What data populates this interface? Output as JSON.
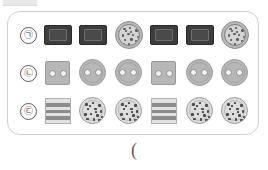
{
  "figure": {
    "title": "",
    "bottom_caption": "(",
    "panel": {
      "border_color": "#cfcfcf",
      "background": "#ffffff"
    },
    "rows": [
      {
        "label": "㉠",
        "label_name": "row-label-giyeok",
        "items": [
          {
            "kind": "dark-rect",
            "name": "brownie-rectangle"
          },
          {
            "kind": "dark-rect",
            "name": "brownie-rectangle"
          },
          {
            "kind": "speckle-circle",
            "name": "speckled-round-cookie"
          },
          {
            "kind": "dark-rect",
            "name": "brownie-rectangle"
          },
          {
            "kind": "dark-rect",
            "name": "brownie-rectangle"
          },
          {
            "kind": "speckle-circle",
            "name": "speckled-round-cookie"
          }
        ]
      },
      {
        "label": "㉡",
        "label_name": "row-label-nieun",
        "items": [
          {
            "kind": "hole-square",
            "name": "two-hole-square-cracker"
          },
          {
            "kind": "hole-circle",
            "name": "two-hole-round-cracker"
          },
          {
            "kind": "hole-circle",
            "name": "two-hole-round-cracker"
          },
          {
            "kind": "hole-square",
            "name": "two-hole-square-cracker"
          },
          {
            "kind": "hole-circle",
            "name": "two-hole-round-cracker"
          },
          {
            "kind": "hole-circle",
            "name": "two-hole-round-cracker"
          }
        ]
      },
      {
        "label": "㉢",
        "label_name": "row-label-digeut",
        "items": [
          {
            "kind": "striped-square",
            "name": "striped-wafer-square"
          },
          {
            "kind": "chip-circle",
            "name": "chocolate-chip-round-cookie"
          },
          {
            "kind": "chip-circle",
            "name": "chocolate-chip-round-cookie"
          },
          {
            "kind": "striped-square",
            "name": "striped-wafer-square"
          },
          {
            "kind": "chip-circle",
            "name": "chocolate-chip-round-cookie"
          },
          {
            "kind": "chip-circle",
            "name": "chocolate-chip-round-cookie"
          }
        ]
      }
    ],
    "colors": {
      "dark_item": "#3d3d3d",
      "light_item": "#b7b7b7",
      "stripe": "#8c8c8c",
      "chip": "#4d4d4d",
      "hole": "#f2f2f2"
    },
    "speckle_positions": [
      [
        4,
        3,
        3,
        2
      ],
      [
        10,
        2,
        2,
        2
      ],
      [
        16,
        4,
        3,
        3
      ],
      [
        21,
        7,
        2,
        2
      ],
      [
        3,
        9,
        2,
        3
      ],
      [
        8,
        8,
        3,
        2
      ],
      [
        13,
        9,
        2,
        2
      ],
      [
        18,
        11,
        3,
        2
      ],
      [
        5,
        14,
        2,
        2
      ],
      [
        11,
        13,
        3,
        3
      ],
      [
        16,
        15,
        2,
        2
      ],
      [
        21,
        13,
        2,
        3
      ],
      [
        3,
        18,
        3,
        2
      ],
      [
        9,
        18,
        2,
        3
      ],
      [
        14,
        19,
        3,
        2
      ],
      [
        19,
        18,
        2,
        2
      ],
      [
        7,
        22,
        2,
        2
      ],
      [
        13,
        23,
        3,
        2
      ],
      [
        18,
        22,
        2,
        3
      ],
      [
        6,
        5,
        2,
        2
      ],
      [
        22,
        17,
        2,
        2
      ],
      [
        11,
        6,
        2,
        2
      ]
    ],
    "chip_positions": [
      [
        5,
        5,
        3,
        3
      ],
      [
        12,
        4,
        2,
        2
      ],
      [
        18,
        6,
        3,
        3
      ],
      [
        7,
        10,
        2,
        2
      ],
      [
        14,
        10,
        3,
        2
      ],
      [
        20,
        12,
        2,
        3
      ],
      [
        4,
        15,
        3,
        3
      ],
      [
        10,
        15,
        2,
        2
      ],
      [
        16,
        16,
        3,
        3
      ],
      [
        21,
        18,
        2,
        2
      ],
      [
        6,
        20,
        3,
        2
      ],
      [
        13,
        20,
        2,
        3
      ],
      [
        18,
        21,
        3,
        2
      ],
      [
        9,
        7,
        2,
        2
      ],
      [
        15,
        13,
        2,
        2
      ]
    ],
    "stripe_bands": [
      {
        "top": 4,
        "height": 4
      },
      {
        "top": 11,
        "height": 3
      },
      {
        "top": 17,
        "height": 4
      }
    ]
  }
}
